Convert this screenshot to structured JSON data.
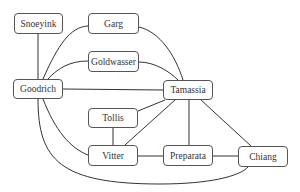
{
  "nodes": {
    "snoeyink": "Snoeyink",
    "garg": "Garg",
    "goldwasser": "Goldwasser",
    "goodrich": "Goodrich",
    "tamassia": "Tamassia",
    "tollis": "Tollis",
    "vitter": "Vitter",
    "preparata": "Preparata",
    "chiang": "Chiang"
  },
  "edges": [
    [
      "Snoeyink",
      "Goodrich"
    ],
    [
      "Goodrich",
      "Garg"
    ],
    [
      "Goodrich",
      "Goldwasser"
    ],
    [
      "Goodrich",
      "Tamassia"
    ],
    [
      "Goodrich",
      "Vitter"
    ],
    [
      "Goodrich",
      "Chiang"
    ],
    [
      "Garg",
      "Tamassia"
    ],
    [
      "Goldwasser",
      "Tamassia"
    ],
    [
      "Tollis",
      "Tamassia"
    ],
    [
      "Tollis",
      "Vitter"
    ],
    [
      "Vitter",
      "Tamassia"
    ],
    [
      "Vitter",
      "Preparata"
    ],
    [
      "Preparata",
      "Tamassia"
    ],
    [
      "Preparata",
      "Chiang"
    ],
    [
      "Chiang",
      "Tamassia"
    ]
  ]
}
